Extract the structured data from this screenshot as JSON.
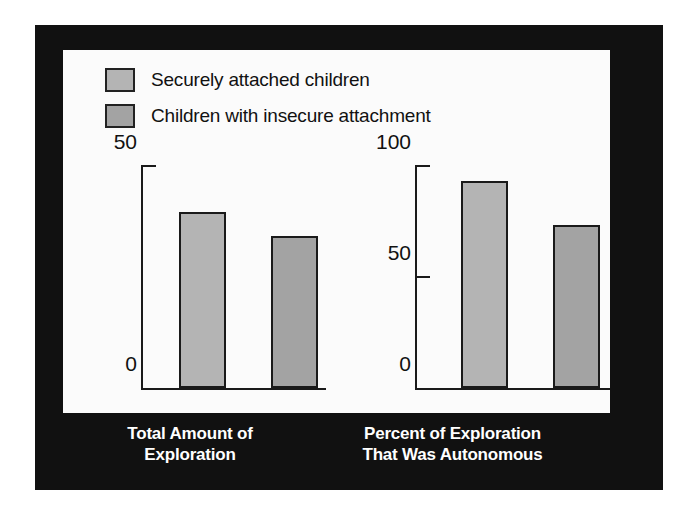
{
  "colors": {
    "frame": "#111111",
    "panel": "#fbfbfb",
    "bar_secure": "#b4b4b4",
    "bar_insecure": "#a3a3a3",
    "axis": "#1a1a1a",
    "caption_text": "#ffffff"
  },
  "legend": {
    "items": [
      {
        "label": "Securely attached children",
        "color": "#b4b4b4",
        "swatch_name": "legend-swatch-secure"
      },
      {
        "label": "Children with insecure attachment",
        "color": "#a3a3a3",
        "swatch_name": "legend-swatch-insecure"
      }
    ]
  },
  "left_chart": {
    "caption_line1": "Total Amount of",
    "caption_line2": "Exploration",
    "ticks": [
      "50",
      "0"
    ]
  },
  "right_chart": {
    "caption_line1": "Percent of Exploration",
    "caption_line2": "That Was Autonomous",
    "ticks": [
      "100",
      "50",
      "0"
    ]
  },
  "chart_data": [
    {
      "type": "bar",
      "title": "Total Amount of Exploration",
      "xlabel": "Total Amount of Exploration",
      "ylabel": "",
      "categories": [
        "Securely attached children",
        "Children with insecure attachment"
      ],
      "values": [
        39.5,
        34
      ],
      "ylim": [
        0,
        50
      ],
      "yticks": [
        0,
        50
      ],
      "grid": false,
      "legend_position": "top-left"
    },
    {
      "type": "bar",
      "title": "Percent of Exploration That Was Autonomous",
      "xlabel": "Percent of Exploration That Was Autonomous",
      "ylabel": "",
      "categories": [
        "Securely attached children",
        "Children with insecure attachment"
      ],
      "values": [
        93,
        73
      ],
      "ylim": [
        0,
        100
      ],
      "yticks": [
        0,
        50,
        100
      ],
      "grid": false,
      "legend_position": "top-left"
    }
  ]
}
